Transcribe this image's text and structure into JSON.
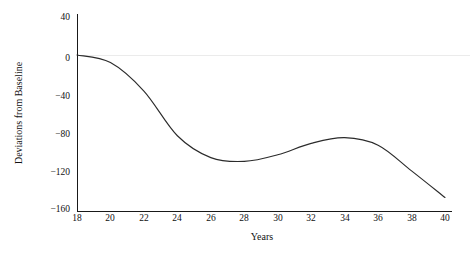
{
  "chart_data": {
    "type": "line",
    "title": "",
    "xlabel": "Years",
    "ylabel": "Deviations from Baseline",
    "xlim": [
      18,
      40
    ],
    "ylim": [
      -160,
      40
    ],
    "grid": false,
    "legend": "none",
    "baseline_reference": 0,
    "x": [
      18,
      20,
      22,
      24,
      26,
      28,
      30,
      32,
      34,
      36,
      38,
      40
    ],
    "xticks": [
      "18",
      "20",
      "22",
      "24",
      "26",
      "28",
      "30",
      "32",
      "34",
      "36",
      "38",
      "40"
    ],
    "yticks": [
      "40",
      "0",
      "−40",
      "−80",
      "−120",
      "−160"
    ],
    "ytick_values": [
      40,
      0,
      -40,
      -80,
      -120,
      -160
    ],
    "series": [
      {
        "name": "Deviation",
        "color": "#2b2b2b",
        "values": [
          0,
          -8,
          -38,
          -85,
          -108,
          -112,
          -105,
          -93,
          -87,
          -95,
          -122,
          -150
        ]
      }
    ]
  },
  "axis": {
    "x_title": "Years",
    "y_title": "Deviations from Baseline"
  },
  "ticks": {
    "y": [
      {
        "label": "40"
      },
      {
        "label": "0"
      },
      {
        "label": "−40"
      },
      {
        "label": "−80"
      },
      {
        "label": "−120"
      },
      {
        "label": "−160"
      }
    ],
    "x": [
      {
        "label": "18"
      },
      {
        "label": "20"
      },
      {
        "label": "22"
      },
      {
        "label": "24"
      },
      {
        "label": "26"
      },
      {
        "label": "28"
      },
      {
        "label": "30"
      },
      {
        "label": "32"
      },
      {
        "label": "34"
      },
      {
        "label": "36"
      },
      {
        "label": "38"
      },
      {
        "label": "40"
      }
    ]
  },
  "style": {
    "line_color": "#2b2b2b",
    "axis_color": "#000000",
    "baseline_color": "#ebebeb",
    "background": "#ffffff",
    "text_color": "#111111"
  }
}
